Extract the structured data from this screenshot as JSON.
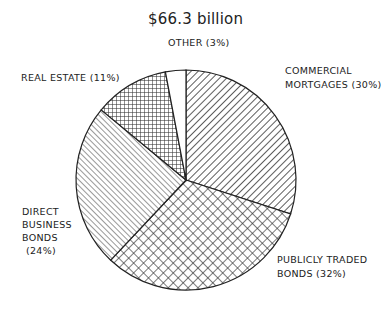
{
  "chart_data": {
    "type": "pie",
    "title": "$66.3 billion",
    "start_angle_deg": 0,
    "direction": "clockwise",
    "slices": [
      {
        "label": "COMMERCIAL MORTGAGES",
        "display": [
          "COMMERCIAL",
          "MORTGAGES  (30%)"
        ],
        "value": 30,
        "pattern": "diagonal-down"
      },
      {
        "label": "PUBLICLY TRADED BONDS",
        "display": [
          "PUBLICLY TRADED",
          "BONDS  (32%)"
        ],
        "value": 32,
        "pattern": "diamond-crosshatch"
      },
      {
        "label": "DIRECT BUSINESS BONDS",
        "display": [
          "DIRECT",
          "BUSINESS",
          "BONDS",
          "(24%)"
        ],
        "value": 24,
        "pattern": "diagonal-up"
      },
      {
        "label": "REAL ESTATE",
        "display": [
          "REAL ESTATE  (11%)"
        ],
        "value": 11,
        "pattern": "grid-crosshatch"
      },
      {
        "label": "OTHER",
        "display": [
          "OTHER  (3%)"
        ],
        "value": 3,
        "pattern": "none"
      }
    ],
    "legend": "none (direct labels)",
    "center": [
      186,
      180
    ],
    "radius": 110
  }
}
